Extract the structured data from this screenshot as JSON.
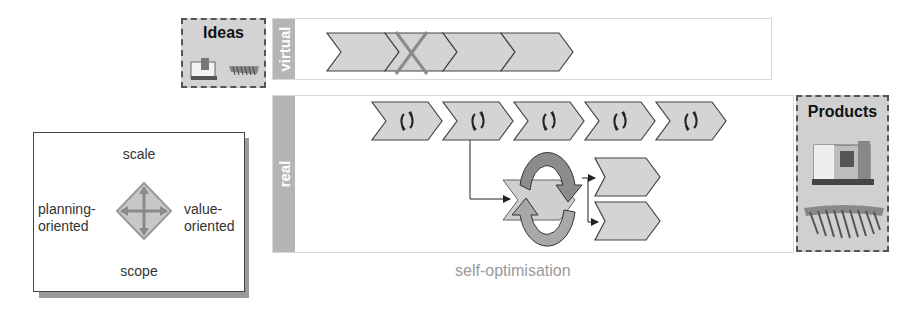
{
  "ideas": {
    "title": "Ideas",
    "images": [
      "machine-tool-icon",
      "gear-blades-icon"
    ]
  },
  "lanes": {
    "virtual": {
      "label": "virtual",
      "chevrons": [
        {
          "crossed": false
        },
        {
          "crossed": true
        },
        {
          "crossed": false
        },
        {
          "crossed": false
        }
      ]
    },
    "real": {
      "label": "real",
      "chevrons": [
        {
          "icon": "cycle-icon"
        },
        {
          "icon": "cycle-icon"
        },
        {
          "icon": "cycle-icon"
        },
        {
          "icon": "cycle-icon"
        },
        {
          "icon": "cycle-icon"
        }
      ],
      "loop": {
        "icon": "circular-arrows-icon",
        "outputs": 2
      }
    }
  },
  "products": {
    "title": "Products",
    "images": [
      "machine-tool-icon",
      "gear-blades-icon"
    ]
  },
  "legend": {
    "top": "scale",
    "bottom": "scope",
    "left_line1": "planning-",
    "left_line2": "oriented",
    "right_line1": "value-",
    "right_line2": "oriented",
    "icon": "four-way-diamond-icon"
  },
  "caption": "self-optimisation",
  "colors": {
    "chevron_fill": "#d4d4d4",
    "chevron_stroke": "#444444",
    "lane_label_bg": "#b5b5b5",
    "cross": "#8a8a8a",
    "caption": "#9a9a9a"
  }
}
